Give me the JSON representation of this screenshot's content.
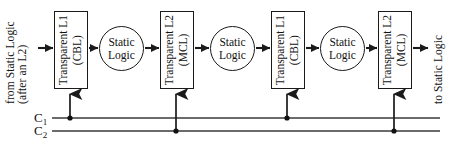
{
  "diagram": {
    "input_label": {
      "line1": "from Static Logic",
      "line2": "(after an L2)"
    },
    "output_label": "to Static Logic",
    "latches": [
      {
        "name": "latch-1",
        "line1": "Transparent L1",
        "line2": "(CBL)",
        "clock": "C1"
      },
      {
        "name": "latch-2",
        "line1": "Transparent L2",
        "line2": "(MCL)",
        "clock": "C2"
      },
      {
        "name": "latch-3",
        "line1": "Transparent L1",
        "line2": "(CBL)",
        "clock": "C1"
      },
      {
        "name": "latch-4",
        "line1": "Transparent L2",
        "line2": "(MCL)",
        "clock": "C2"
      }
    ],
    "logic_blocks": [
      {
        "name": "static-logic-1",
        "line1": "Static",
        "line2": "Logic"
      },
      {
        "name": "static-logic-2",
        "line1": "Static",
        "line2": "Logic"
      },
      {
        "name": "static-logic-3",
        "line1": "Static",
        "line2": "Logic"
      }
    ],
    "clocks": [
      {
        "name": "clock-c1",
        "label": "C",
        "subscript": "1"
      },
      {
        "name": "clock-c2",
        "label": "C",
        "subscript": "2"
      }
    ],
    "colors": {
      "stroke": "#1a1a1a",
      "text": "#111111",
      "background": "#ffffff",
      "clock_line": "#3a3a3a"
    }
  }
}
